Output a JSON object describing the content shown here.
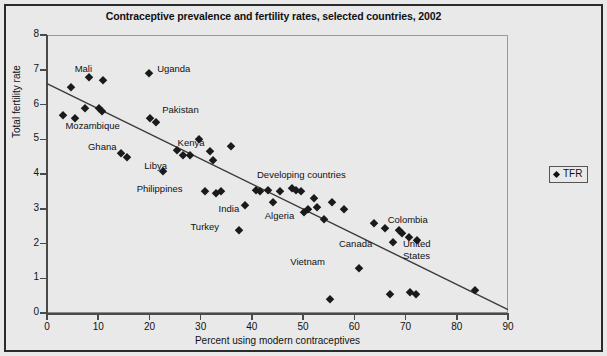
{
  "figure": {
    "title": "Contraceptive prevalence and fertility rates, selected countries, 2002"
  },
  "legend": {
    "marker_name": "diamond-marker",
    "entry": "TFR"
  },
  "axes": {
    "x_title": "Percent using modern contraceptives",
    "y_title": "Total fertility rate",
    "x_ticks": [
      "0",
      "10",
      "20",
      "30",
      "40",
      "50",
      "60",
      "70",
      "80",
      "90"
    ],
    "y_ticks": [
      "0",
      "1",
      "2",
      "3",
      "4",
      "5",
      "6",
      "7",
      "8"
    ]
  },
  "chart_data": {
    "type": "scatter",
    "title": "Contraceptive prevalence and fertility rates, selected countries, 2002",
    "xlabel": "Percent using modern contraceptives",
    "ylabel": "Total fertility rate",
    "xlim": [
      0,
      90
    ],
    "ylim": [
      0,
      8
    ],
    "xticks": [
      0,
      10,
      20,
      30,
      40,
      50,
      60,
      70,
      80,
      90
    ],
    "yticks": [
      0,
      1,
      2,
      3,
      4,
      5,
      6,
      7,
      8
    ],
    "grid": false,
    "legend": {
      "entries": [
        "TFR"
      ],
      "position": "right-outside"
    },
    "series": [
      {
        "name": "TFR",
        "marker": "diamond",
        "color": "#1a1a1a",
        "points": [
          {
            "x": 3.2,
            "y": 5.7
          },
          {
            "x": 4.6,
            "y": 6.5
          },
          {
            "x": 5.4,
            "y": 5.6
          },
          {
            "x": 7.4,
            "y": 5.9
          },
          {
            "x": 8.2,
            "y": 6.8
          },
          {
            "x": 10.1,
            "y": 5.9
          },
          {
            "x": 10.8,
            "y": 5.8
          },
          {
            "x": 11.0,
            "y": 6.7
          },
          {
            "x": 14.5,
            "y": 4.6
          },
          {
            "x": 15.6,
            "y": 4.5
          },
          {
            "x": 19.9,
            "y": 6.9
          },
          {
            "x": 20.2,
            "y": 5.6
          },
          {
            "x": 21.3,
            "y": 5.5
          },
          {
            "x": 22.6,
            "y": 4.1
          },
          {
            "x": 25.4,
            "y": 4.7
          },
          {
            "x": 26.6,
            "y": 4.55
          },
          {
            "x": 28.0,
            "y": 4.55
          },
          {
            "x": 29.6,
            "y": 5.0
          },
          {
            "x": 30.8,
            "y": 3.5
          },
          {
            "x": 31.9,
            "y": 4.65
          },
          {
            "x": 32.4,
            "y": 4.4
          },
          {
            "x": 33.0,
            "y": 3.45
          },
          {
            "x": 34.0,
            "y": 3.5
          },
          {
            "x": 36.0,
            "y": 4.8
          },
          {
            "x": 37.5,
            "y": 2.4
          },
          {
            "x": 38.6,
            "y": 3.1
          },
          {
            "x": 40.8,
            "y": 3.55
          },
          {
            "x": 41.5,
            "y": 3.5
          },
          {
            "x": 43.2,
            "y": 3.55
          },
          {
            "x": 44.2,
            "y": 3.2
          },
          {
            "x": 45.4,
            "y": 3.5
          },
          {
            "x": 47.8,
            "y": 3.6
          },
          {
            "x": 48.6,
            "y": 3.55
          },
          {
            "x": 49.5,
            "y": 3.5
          },
          {
            "x": 50.1,
            "y": 2.9
          },
          {
            "x": 50.9,
            "y": 3.0
          },
          {
            "x": 52.1,
            "y": 3.3
          },
          {
            "x": 52.8,
            "y": 3.05
          },
          {
            "x": 54.0,
            "y": 2.7
          },
          {
            "x": 55.2,
            "y": 0.4
          },
          {
            "x": 55.6,
            "y": 3.2
          },
          {
            "x": 58.0,
            "y": 3.0
          },
          {
            "x": 60.9,
            "y": 1.3
          },
          {
            "x": 63.8,
            "y": 2.6
          },
          {
            "x": 66.0,
            "y": 2.45
          },
          {
            "x": 66.9,
            "y": 0.55
          },
          {
            "x": 67.6,
            "y": 2.05
          },
          {
            "x": 68.7,
            "y": 2.4
          },
          {
            "x": 69.4,
            "y": 2.3
          },
          {
            "x": 70.6,
            "y": 2.2
          },
          {
            "x": 70.9,
            "y": 0.6
          },
          {
            "x": 72.1,
            "y": 0.55
          },
          {
            "x": 72.3,
            "y": 2.1
          },
          {
            "x": 83.5,
            "y": 0.65
          }
        ]
      }
    ],
    "trendline": {
      "type": "linear",
      "x_start": 0,
      "y_start": 6.6,
      "x_end": 90,
      "y_end": 0.1
    },
    "annotations": [
      {
        "label": "Mali",
        "x": 5.4,
        "y": 7.0
      },
      {
        "label": "Uganda",
        "x": 21.5,
        "y": 7.0
      },
      {
        "label": "Pakistan",
        "x": 22.5,
        "y": 5.8
      },
      {
        "label": "Mozambique",
        "x": 3.6,
        "y": 5.35
      },
      {
        "label": "Ghana",
        "x": 8.0,
        "y": 4.75
      },
      {
        "label": "Kenya",
        "x": 25.5,
        "y": 4.85
      },
      {
        "label": "Libya",
        "x": 19.0,
        "y": 4.2
      },
      {
        "label": "Philippines",
        "x": 17.5,
        "y": 3.55
      },
      {
        "label": "Developing countries",
        "x": 41.0,
        "y": 3.95
      },
      {
        "label": "India",
        "x": 33.5,
        "y": 2.95
      },
      {
        "label": "Algeria",
        "x": 42.5,
        "y": 2.75
      },
      {
        "label": "Turkey",
        "x": 28.0,
        "y": 2.45
      },
      {
        "label": "Colombia",
        "x": 66.5,
        "y": 2.65
      },
      {
        "label": "Canada",
        "x": 57.0,
        "y": 1.95
      },
      {
        "label": "United",
        "x": 69.5,
        "y": 1.95
      },
      {
        "label": "States",
        "x": 69.5,
        "y": 1.6
      },
      {
        "label": "Vietnam",
        "x": 47.5,
        "y": 1.45
      }
    ]
  }
}
